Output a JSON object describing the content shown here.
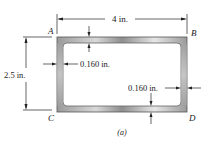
{
  "figure": {
    "caption": "(a)",
    "corners": {
      "A": "A",
      "B": "B",
      "C": "C",
      "D": "D"
    },
    "dimensions": {
      "width": "4 in.",
      "height": "2.5 in.",
      "thickness_left": "0.160 in.",
      "thickness_right": "0.160 in."
    },
    "colors": {
      "tube_light": "#e4e4e4",
      "tube_dark": "#8a8a8a",
      "line": "#222222"
    }
  }
}
